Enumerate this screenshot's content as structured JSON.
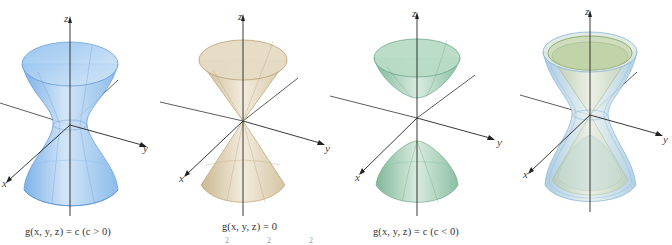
{
  "figure": {
    "panels": [
      {
        "id": "hyperboloid-one-sheet",
        "surface": "hyperboloid of one sheet",
        "caption": "g(x, y, z) = c  (c > 0)",
        "color": "#7fb6e8",
        "axes": {
          "x": "x",
          "y": "y",
          "z": "z"
        }
      },
      {
        "id": "double-cone",
        "surface": "double cone",
        "caption": "g(x, y, z) = 0",
        "color": "#d8c9a8",
        "axes": {
          "x": "x",
          "y": "y",
          "z": "z"
        }
      },
      {
        "id": "hyperboloid-two-sheets",
        "surface": "hyperboloid of two sheets",
        "caption": "g(x, y, z) = c  (c < 0)",
        "color": "#8fc3a6",
        "axes": {
          "x": "x",
          "y": "y",
          "z": "z"
        }
      },
      {
        "id": "combined-level-surfaces",
        "surface": "superimposed level surfaces",
        "caption": "",
        "color": "#a9cbe2",
        "axes": {
          "x": "x",
          "y": "y",
          "z": "z"
        }
      }
    ],
    "cut_off_text": "2    2    2"
  }
}
